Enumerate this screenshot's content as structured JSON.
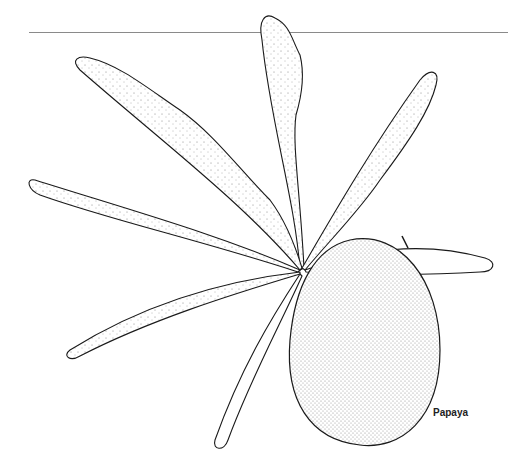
{
  "illustration": {
    "subject": "papaya",
    "description": "Line-and-stipple botanical illustration of a papaya leaf with a papaya fruit",
    "caption": "Papaya"
  },
  "colors": {
    "ink": "#1a1a1a",
    "rule": "#8a8a8a",
    "background": "#ffffff"
  }
}
